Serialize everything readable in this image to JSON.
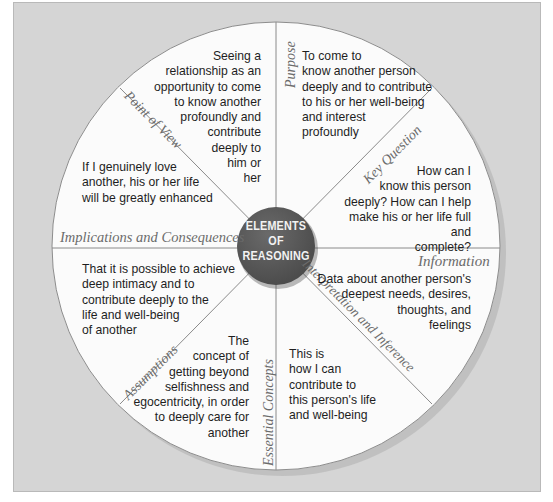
{
  "diagram": {
    "title": "Elements of Reasoning",
    "hub": {
      "line1": "ELEMENTS",
      "line2": "OF",
      "line3": "REASONING"
    },
    "colors": {
      "frame": "#d5d5d5",
      "wheel": "#fbfbfb",
      "hub": "#595959",
      "divider": "#8a8a8a",
      "label": "#6b6b6b"
    },
    "segments": [
      {
        "label": "Purpose",
        "text": "To come to\nknow another person\ndeeply and to contribute\nto his or her well-being\nand interest\nprofoundly"
      },
      {
        "label": "Key Question",
        "text": "How can I\nknow this person\ndeeply? How can I help\nmake his or her life full and\ncomplete?"
      },
      {
        "label": "Information",
        "text": "Data about another person's\ndeepest needs, desires,\nthoughts, and\nfeelings"
      },
      {
        "label": "Interpretation and Inference",
        "text": "This is\nhow I can\ncontribute to\nthis person's life\nand well-being"
      },
      {
        "label": "Essential Concepts",
        "text": "The\nconcept of\ngetting beyond\nselfishness and\negocentricity, in order\nto deeply care for\nanother"
      },
      {
        "label": "Assumptions",
        "text": "That it is possible to achieve\ndeep intimacy and to\ncontribute deeply to the\nlife and well-being\nof another"
      },
      {
        "label": "Implications and Consequences",
        "text": "If I genuinely love\nanother, his or her life\nwill be greatly enhanced"
      },
      {
        "label": "Point of View",
        "text": "Seeing a\nrelationship as an\nopportunity to come\nto know another\nprofoundly and\ncontribute\ndeeply to\nhim or\nher"
      }
    ]
  }
}
